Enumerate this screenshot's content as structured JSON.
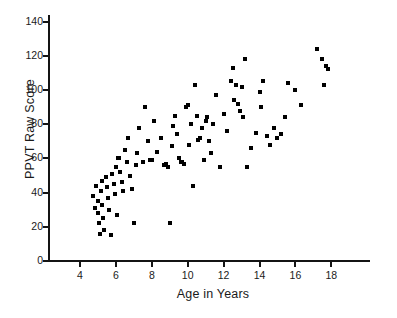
{
  "chart_data": {
    "type": "scatter",
    "title": "",
    "xlabel": "Age in Years",
    "ylabel": "PPVT Raw Score",
    "xlim": [
      3,
      18.5
    ],
    "ylim": [
      0,
      140
    ],
    "xticks": [
      4,
      6,
      8,
      10,
      12,
      14,
      16,
      18
    ],
    "yticks": [
      0,
      20,
      40,
      60,
      80,
      100,
      120,
      140
    ],
    "grid": false,
    "legend": null,
    "marker": "square",
    "marker_color": "#000000",
    "n_points": 105,
    "points": [
      [
        4.75,
        38
      ],
      [
        4.85,
        31
      ],
      [
        4.9,
        44
      ],
      [
        5.0,
        35
      ],
      [
        5.0,
        28
      ],
      [
        5.05,
        22
      ],
      [
        5.1,
        16
      ],
      [
        5.15,
        41
      ],
      [
        5.2,
        47
      ],
      [
        5.25,
        33
      ],
      [
        5.3,
        25
      ],
      [
        5.35,
        18
      ],
      [
        5.45,
        49
      ],
      [
        5.5,
        43
      ],
      [
        5.55,
        37
      ],
      [
        5.6,
        30
      ],
      [
        5.7,
        15
      ],
      [
        5.8,
        51
      ],
      [
        5.9,
        45
      ],
      [
        5.95,
        39
      ],
      [
        6.0,
        55
      ],
      [
        6.05,
        27
      ],
      [
        6.1,
        60
      ],
      [
        6.2,
        60
      ],
      [
        6.25,
        52
      ],
      [
        6.35,
        46
      ],
      [
        6.4,
        41
      ],
      [
        6.5,
        65
      ],
      [
        6.6,
        58
      ],
      [
        6.7,
        72
      ],
      [
        6.8,
        50
      ],
      [
        6.9,
        42
      ],
      [
        7.0,
        22
      ],
      [
        7.1,
        56
      ],
      [
        7.2,
        63
      ],
      [
        7.3,
        78
      ],
      [
        7.5,
        58
      ],
      [
        7.6,
        90
      ],
      [
        7.8,
        70
      ],
      [
        7.9,
        59
      ],
      [
        8.0,
        59
      ],
      [
        8.1,
        82
      ],
      [
        8.3,
        64
      ],
      [
        8.5,
        72
      ],
      [
        8.7,
        56
      ],
      [
        8.8,
        57
      ],
      [
        8.9,
        55
      ],
      [
        9.0,
        22
      ],
      [
        9.1,
        67
      ],
      [
        9.2,
        79
      ],
      [
        9.3,
        85
      ],
      [
        9.4,
        74
      ],
      [
        9.5,
        60
      ],
      [
        9.6,
        58
      ],
      [
        9.7,
        58
      ],
      [
        9.8,
        57
      ],
      [
        9.9,
        90
      ],
      [
        10.0,
        91
      ],
      [
        10.1,
        68
      ],
      [
        10.2,
        80
      ],
      [
        10.3,
        44
      ],
      [
        10.4,
        103
      ],
      [
        10.5,
        85
      ],
      [
        10.6,
        71
      ],
      [
        10.7,
        72
      ],
      [
        10.8,
        78
      ],
      [
        10.9,
        59
      ],
      [
        11.0,
        82
      ],
      [
        11.1,
        84
      ],
      [
        11.2,
        70
      ],
      [
        11.3,
        63
      ],
      [
        11.4,
        80
      ],
      [
        11.6,
        97
      ],
      [
        11.8,
        55
      ],
      [
        12.0,
        86
      ],
      [
        12.2,
        76
      ],
      [
        12.4,
        105
      ],
      [
        12.5,
        113
      ],
      [
        12.6,
        94
      ],
      [
        12.7,
        103
      ],
      [
        12.8,
        92
      ],
      [
        12.9,
        88
      ],
      [
        13.0,
        102
      ],
      [
        13.1,
        84
      ],
      [
        13.2,
        118
      ],
      [
        13.3,
        55
      ],
      [
        13.5,
        66
      ],
      [
        13.8,
        75
      ],
      [
        14.0,
        99
      ],
      [
        14.1,
        90
      ],
      [
        14.2,
        105
      ],
      [
        14.4,
        73
      ],
      [
        14.6,
        68
      ],
      [
        14.8,
        78
      ],
      [
        15.0,
        72
      ],
      [
        15.2,
        74
      ],
      [
        15.4,
        84
      ],
      [
        15.6,
        104
      ],
      [
        16.0,
        100
      ],
      [
        16.3,
        91
      ],
      [
        17.2,
        124
      ],
      [
        17.5,
        118
      ],
      [
        17.6,
        103
      ],
      [
        17.7,
        114
      ],
      [
        17.8,
        112
      ]
    ]
  },
  "axes": {
    "y_tick_labels": [
      "140",
      "120",
      "100",
      "80",
      "60",
      "40",
      "20",
      "0"
    ],
    "x_tick_labels": [
      "4",
      "6",
      "8",
      "10",
      "12",
      "14",
      "16",
      "18"
    ],
    "y_title": "PPVT Raw Score",
    "x_title": "Age in Years"
  },
  "colors": {
    "marker": "#000000",
    "axis": "#141414",
    "text": "#1a1a1a",
    "background": "#ffffff"
  }
}
